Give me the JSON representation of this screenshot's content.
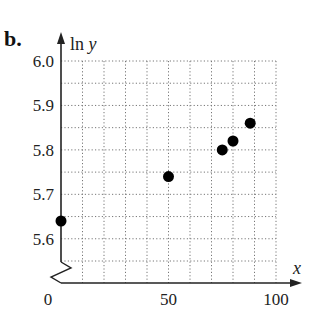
{
  "part_label": "b.",
  "chart_data": {
    "type": "scatter",
    "title": "",
    "xlabel": "x",
    "ylabel": "ln y",
    "xlim": [
      0,
      100
    ],
    "ylim": [
      5.55,
      6.0
    ],
    "axis_break_y": true,
    "grid": true,
    "grid_style": "dotted",
    "x_ticks": [
      0,
      50,
      100
    ],
    "x_tick_labels": [
      "0",
      "50",
      "100"
    ],
    "x_grid_step": 10,
    "y_ticks": [
      5.6,
      5.7,
      5.8,
      5.9,
      6.0
    ],
    "y_tick_labels": [
      "5.6",
      "5.7",
      "5.8",
      "5.9",
      "6.0"
    ],
    "y_grid_step": 0.05,
    "points": [
      {
        "x": 0,
        "y": 5.64
      },
      {
        "x": 50,
        "y": 5.74
      },
      {
        "x": 75,
        "y": 5.8
      },
      {
        "x": 80,
        "y": 5.82
      },
      {
        "x": 88,
        "y": 5.86
      }
    ],
    "marker_color": "#000000"
  }
}
